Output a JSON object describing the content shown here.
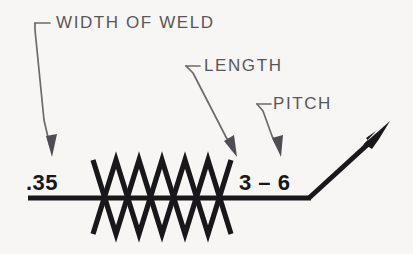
{
  "figure": {
    "kind": "welding-symbol-diagram",
    "background_color": "#f8f6f4",
    "ink_color": "#18171a",
    "annotation_color": "#58565a"
  },
  "annotations": {
    "width_of_weld": {
      "label": "WIDTH OF WELD",
      "leader_points": "35,23 35,30 44,120 52,152"
    },
    "length": {
      "label": "LENGTH",
      "leader_points": "186,66 193,72 228,140 236,152"
    },
    "pitch": {
      "label": "PITCH",
      "leader_points": "257,104 263,110 274,139 280,152"
    }
  },
  "dimensions": {
    "width_of_weld_value": ".35",
    "length_and_pitch_value": "3 – 6"
  },
  "weld_symbol": {
    "type": "seam-weld-zigzag",
    "reference_line": {
      "x1": 28,
      "y1": 198,
      "x2": 310,
      "y2": 198
    },
    "arrow_leader": {
      "x1": 310,
      "y1": 198,
      "x2": 388,
      "y2": 126
    },
    "zigzag_up": "93,234 116,160 139,234 162,160 185,234 208,160 231,234",
    "zigzag_down": "93,160 116,234 139,160 162,234 185,160 208,234 231,160",
    "crossing_points": [
      116,
      162,
      208
    ]
  }
}
